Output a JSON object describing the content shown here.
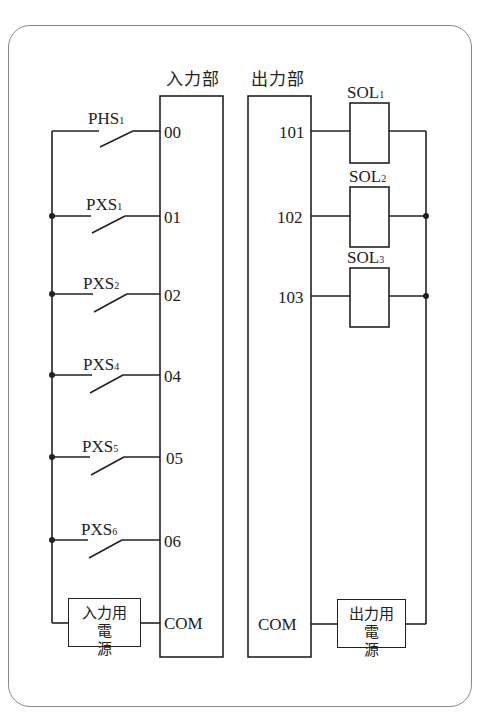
{
  "diagram": {
    "input_unit": {
      "title": "入力部",
      "terminals": [
        "00",
        "01",
        "02",
        "04",
        "05",
        "06"
      ],
      "com": "COM"
    },
    "output_unit": {
      "title": "出力部",
      "terminals": [
        "101",
        "102",
        "103"
      ],
      "com": "COM"
    },
    "switches": [
      {
        "name": "PHS",
        "sub": "1",
        "terminal": "00"
      },
      {
        "name": "PXS",
        "sub": "1",
        "terminal": "01"
      },
      {
        "name": "PXS",
        "sub": "2",
        "terminal": "02"
      },
      {
        "name": "PXS",
        "sub": "4",
        "terminal": "04"
      },
      {
        "name": "PXS",
        "sub": "5",
        "terminal": "05"
      },
      {
        "name": "PXS",
        "sub": "6",
        "terminal": "06"
      }
    ],
    "solenoids": [
      {
        "name": "SOL",
        "sub": "1",
        "terminal": "101"
      },
      {
        "name": "SOL",
        "sub": "2",
        "terminal": "102"
      },
      {
        "name": "SOL",
        "sub": "3",
        "terminal": "103"
      }
    ],
    "input_power": {
      "line1": "入力用",
      "line2": "電源"
    },
    "output_power": {
      "line1": "出力用",
      "line2": "電源"
    },
    "line_color": "#222222",
    "frame_color": "#8a8a8a"
  }
}
